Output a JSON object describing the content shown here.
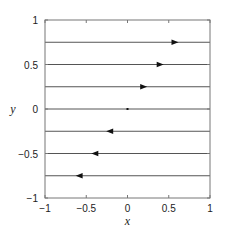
{
  "chart_data": {
    "type": "line",
    "title": "",
    "xlabel": "x",
    "ylabel": "y",
    "xlim": [
      -1,
      1
    ],
    "ylim": [
      -1,
      1
    ],
    "grid": false,
    "legend": null,
    "xticks": [
      -1,
      -0.5,
      0,
      0.5,
      1
    ],
    "yticks": [
      -1,
      -0.5,
      0,
      0.5,
      1
    ],
    "xtick_labels": [
      "−1",
      "−0.5",
      "0",
      "0.5",
      "1"
    ],
    "ytick_labels": [
      "−1",
      "−0.5",
      "0",
      "0.5",
      "1"
    ],
    "series": [
      {
        "name": "y=0.75",
        "y": 0.75,
        "x": [
          -1,
          1
        ],
        "arrow_x": 0.57,
        "direction": "right"
      },
      {
        "name": "y=0.5",
        "y": 0.5,
        "x": [
          -1,
          1
        ],
        "arrow_x": 0.39,
        "direction": "right"
      },
      {
        "name": "y=0.25",
        "y": 0.25,
        "x": [
          -1,
          1
        ],
        "arrow_x": 0.19,
        "direction": "right"
      },
      {
        "name": "y=0",
        "y": 0,
        "x": [
          -1,
          1
        ],
        "arrow_x": 0.0,
        "direction": "none"
      },
      {
        "name": "y=-0.25",
        "y": -0.25,
        "x": [
          -1,
          1
        ],
        "arrow_x": -0.21,
        "direction": "left"
      },
      {
        "name": "y=-0.5",
        "y": -0.5,
        "x": [
          -1,
          1
        ],
        "arrow_x": -0.39,
        "direction": "left"
      },
      {
        "name": "y=-0.75",
        "y": -0.75,
        "x": [
          -1,
          1
        ],
        "arrow_x": -0.58,
        "direction": "left"
      }
    ],
    "colors": {
      "line": "#555555",
      "axes": "#777777",
      "arrow": "#111111"
    }
  }
}
